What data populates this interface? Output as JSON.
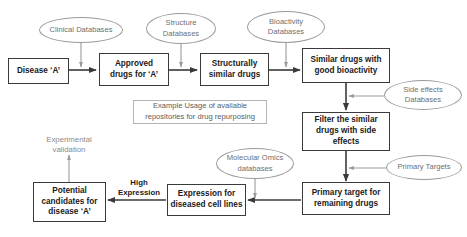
{
  "diagram": {
    "title": "Example Usage of available repositories for drug repurposing",
    "caption": {
      "line1": "Example Usage of available",
      "line2": "repositories for drug repurposing"
    },
    "colors": {
      "process_border": "#3a3a3a",
      "process_text": "#1a1a1a",
      "database_border": "#9a9a9a",
      "database_text": "#6e6e6e",
      "caption_border": "#b5b5b5",
      "caption_text": "#5c5c5c",
      "arrow_dark": "#3a3a3a",
      "arrow_gray": "#9a9a9a",
      "background": "#ffffff"
    },
    "process_nodes": [
      {
        "id": "disease",
        "line1": "Disease ‘A’",
        "line2": ""
      },
      {
        "id": "approved-drugs",
        "line1": "Approved",
        "line2": "drugs for ‘A’"
      },
      {
        "id": "structurally-similar",
        "line1": "Structurally",
        "line2": "similar drugs"
      },
      {
        "id": "similar-bioactivity",
        "line1": "Similar drugs with",
        "line2": "good bioactivity"
      },
      {
        "id": "filter-side-effects",
        "line1": "Filter the similar",
        "line2": "drugs with side",
        "line3": "effects"
      },
      {
        "id": "primary-target",
        "line1": "Primary target for",
        "line2": "remaining drugs"
      },
      {
        "id": "expression-cell-lines",
        "line1": "Expression for",
        "line2": "diseased cell lines"
      },
      {
        "id": "potential-candidates",
        "line1": "Potential",
        "line2": "candidates for",
        "line3": "disease ‘A’"
      }
    ],
    "database_nodes": [
      {
        "id": "clinical-databases",
        "line1": "Clinical Databases",
        "line2": ""
      },
      {
        "id": "structure-databases",
        "line1": "Structure",
        "line2": "Databases"
      },
      {
        "id": "bioactivity-databases",
        "line1": "Bioactivity",
        "line2": "Databases"
      },
      {
        "id": "side-effects-databases",
        "line1": "Side effects",
        "line2": "Databases"
      },
      {
        "id": "molecular-omics-databases",
        "line1": "Molecular Omics",
        "line2": "databases"
      },
      {
        "id": "primary-targets",
        "line1": "Primary Targets",
        "line2": ""
      }
    ],
    "free_labels": [
      {
        "id": "experimental-validation",
        "line1": "Experimental",
        "line2": "validation"
      },
      {
        "id": "high-expression",
        "line1": "High",
        "line2": "Expression"
      }
    ],
    "edges": [
      {
        "from": "disease",
        "to": "approved-drugs",
        "style": "dark"
      },
      {
        "from": "approved-drugs",
        "to": "structurally-similar",
        "style": "dark"
      },
      {
        "from": "structurally-similar",
        "to": "similar-bioactivity",
        "style": "dark"
      },
      {
        "from": "similar-bioactivity",
        "to": "filter-side-effects",
        "style": "dark"
      },
      {
        "from": "filter-side-effects",
        "to": "primary-target",
        "style": "dark"
      },
      {
        "from": "primary-target",
        "to": "expression-cell-lines",
        "style": "dark"
      },
      {
        "from": "expression-cell-lines",
        "to": "potential-candidates",
        "style": "dark",
        "label": "High Expression"
      },
      {
        "from": "potential-candidates",
        "to": "experimental-validation",
        "style": "gray"
      },
      {
        "from": "clinical-databases",
        "to": "approved-drugs",
        "style": "gray"
      },
      {
        "from": "structure-databases",
        "to": "structurally-similar",
        "style": "gray"
      },
      {
        "from": "bioactivity-databases",
        "to": "similar-bioactivity",
        "style": "gray"
      },
      {
        "from": "side-effects-databases",
        "to": "filter-side-effects",
        "style": "gray"
      },
      {
        "from": "primary-targets",
        "to": "primary-target",
        "style": "gray"
      },
      {
        "from": "molecular-omics-databases",
        "to": "expression-cell-lines",
        "style": "gray"
      }
    ]
  }
}
